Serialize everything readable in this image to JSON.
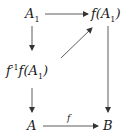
{
  "nodes": {
    "a1": {
      "base": "A",
      "sub": "1"
    },
    "fa1": {
      "pre": "f(",
      "base": "A",
      "sub": "1",
      "post": ")"
    },
    "preimage": {
      "pre": "f",
      "sup": "-1",
      "mid": "f(",
      "base": "A",
      "sub": "1",
      "post": ")"
    },
    "a": {
      "base": "A"
    },
    "b": {
      "base": "B"
    }
  },
  "arrows": [
    {
      "from": "A1",
      "to": "f(A1)",
      "label": ""
    },
    {
      "from": "A1",
      "to": "f^-1 f(A1)",
      "label": ""
    },
    {
      "from": "f^-1 f(A1)",
      "to": "f(A1)",
      "label": ""
    },
    {
      "from": "f^-1 f(A1)",
      "to": "A",
      "label": ""
    },
    {
      "from": "f(A1)",
      "to": "B",
      "label": ""
    },
    {
      "from": "A",
      "to": "B",
      "label": "f"
    }
  ],
  "colors": {
    "ink": "#1a1a1a",
    "background": "#ffffff"
  }
}
